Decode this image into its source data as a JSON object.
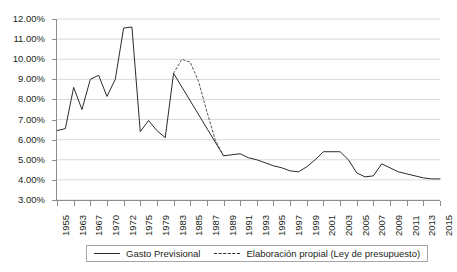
{
  "chart_data": {
    "type": "line",
    "title": "",
    "xlabel": "",
    "ylabel": "",
    "grid": true,
    "legend_position": "bottom",
    "ylim": [
      3.0,
      12.0
    ],
    "ytick_labels": [
      "12.00%",
      "11.00%",
      "10.00%",
      "9.00%",
      "8.00%",
      "7.00%",
      "6.00%",
      "5.00%",
      "4.00%",
      "3.00%"
    ],
    "ytick_values": [
      12.0,
      11.0,
      10.0,
      9.0,
      8.0,
      7.0,
      6.0,
      5.0,
      4.0,
      3.0
    ],
    "categories": [
      "1955",
      "1963",
      "1967",
      "1970",
      "1972",
      "1975",
      "1979",
      "1983",
      "1985",
      "1987",
      "1989",
      "1991",
      "1993",
      "1995",
      "1997",
      "1999",
      "2001",
      "2003",
      "2005",
      "2007",
      "2009",
      "2011",
      "2013",
      "2015"
    ],
    "xtick_labels": [
      "1955",
      "1963",
      "1967",
      "1970",
      "1972",
      "1975",
      "1979",
      "1983",
      "1985",
      "1987",
      "1989",
      "1991",
      "1993",
      "1995",
      "1997",
      "1999",
      "2001",
      "2003",
      "2005",
      "2007",
      "2009",
      "2011",
      "2013",
      "2015"
    ],
    "series": [
      {
        "name": "Gasto Previsional",
        "style": "solid",
        "color": "#2b2b2b",
        "x": [
          0.0,
          0.5,
          1.0,
          1.5,
          2.0,
          2.5,
          3.0,
          3.5,
          4.0,
          4.5,
          5.0,
          5.5,
          6.0,
          6.5,
          7.0,
          10.0,
          10.5,
          11.0,
          11.5,
          12.0,
          12.5,
          13.0,
          13.5,
          14.0,
          14.5,
          15.0,
          15.5,
          16.0,
          16.5,
          17.0,
          17.5,
          18.0,
          18.5,
          19.0,
          19.5,
          20.0,
          20.5,
          21.0,
          21.5,
          22.0,
          22.5,
          23.0
        ],
        "values": [
          6.45,
          6.55,
          8.6,
          7.5,
          9.0,
          9.2,
          8.15,
          9.0,
          11.55,
          11.6,
          6.4,
          6.95,
          6.45,
          6.1,
          9.3,
          5.2,
          5.25,
          5.3,
          5.1,
          5.0,
          4.85,
          4.7,
          4.6,
          4.45,
          4.4,
          4.65,
          5.0,
          5.4,
          5.4,
          5.4,
          5.0,
          4.35,
          4.15,
          4.2,
          4.8,
          4.6,
          4.4,
          4.3,
          4.2,
          4.1,
          4.05,
          4.05
        ]
      },
      {
        "name": "Elaboración propial (Ley de presupuesto)",
        "style": "dashed",
        "color": "#5a5a5a",
        "x": [
          7.0,
          7.5,
          8.0,
          8.5,
          9.0,
          9.5,
          10.0
        ],
        "values": [
          9.3,
          10.0,
          9.85,
          8.9,
          7.4,
          6.0,
          5.2
        ]
      }
    ]
  },
  "legend": {
    "entries": [
      {
        "label": "Gasto Previsional",
        "style": "solid"
      },
      {
        "label": "Elaboración propial (Ley de presupuesto)",
        "style": "dashed"
      }
    ]
  }
}
